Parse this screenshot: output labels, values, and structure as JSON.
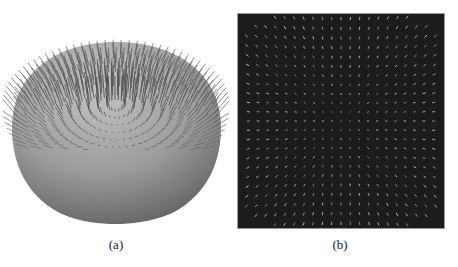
{
  "figure": {
    "subfigures": [
      {
        "id": "a",
        "label": "(a)",
        "description": "3D dome-shaped surface with a field of normal vectors (needles) radiating from its upper region",
        "surface_color_light": "#b8b8b8",
        "surface_color_dark": "#5e5e5e",
        "needle_color": "#555555",
        "background": "#ffffff"
      },
      {
        "id": "b",
        "label": "(b)",
        "description": "Top-down projection of the vector field shown as short light dashes on a dark square background",
        "background": "#1c1c1c",
        "dash_color": "#c8c8c8",
        "border_color": "#9a9a9a"
      }
    ]
  }
}
